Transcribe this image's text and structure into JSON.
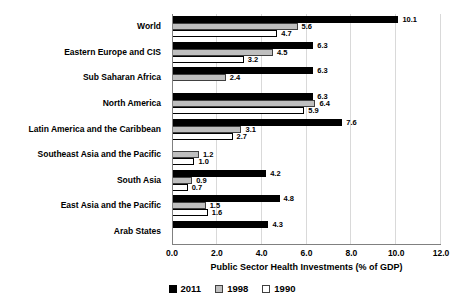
{
  "chart_data": {
    "type": "bar",
    "orientation": "horizontal",
    "xlabel": "Public Sector Health Investments (% of GDP)",
    "xlim": [
      0,
      12
    ],
    "xticks": [
      0,
      2,
      4,
      6,
      8,
      10,
      12
    ],
    "xtick_labels": [
      "0.0",
      "2.0",
      "4.0",
      "6.0",
      "8.0",
      "10.0",
      "12.0"
    ],
    "grid": true,
    "legend_position": "bottom-center",
    "categories": [
      "World",
      "Eastern Europe and CIS",
      "Sub Saharan Africa",
      "North America",
      "Latin America and the Caribbean",
      "Southeast Asia and the Pacific",
      "South Asia",
      "East Asia and the Pacific",
      "Arab States"
    ],
    "series": [
      {
        "name": "2011",
        "color": "#000000",
        "border": "#000000",
        "values": [
          10.1,
          6.3,
          6.3,
          6.3,
          7.6,
          null,
          4.2,
          4.8,
          4.3
        ]
      },
      {
        "name": "1998",
        "color": "#BFBFBF",
        "border": "#404040",
        "values": [
          5.6,
          4.5,
          2.4,
          6.4,
          3.1,
          1.2,
          0.9,
          1.5,
          null
        ]
      },
      {
        "name": "1990",
        "color": "#FFFFFF",
        "border": "#000000",
        "values": [
          4.7,
          3.2,
          null,
          5.9,
          2.7,
          1.0,
          0.7,
          1.6,
          null
        ]
      }
    ]
  },
  "colors": {
    "gridline": "#D9D9D9",
    "axis_line": "#808080",
    "text": "#000000"
  }
}
